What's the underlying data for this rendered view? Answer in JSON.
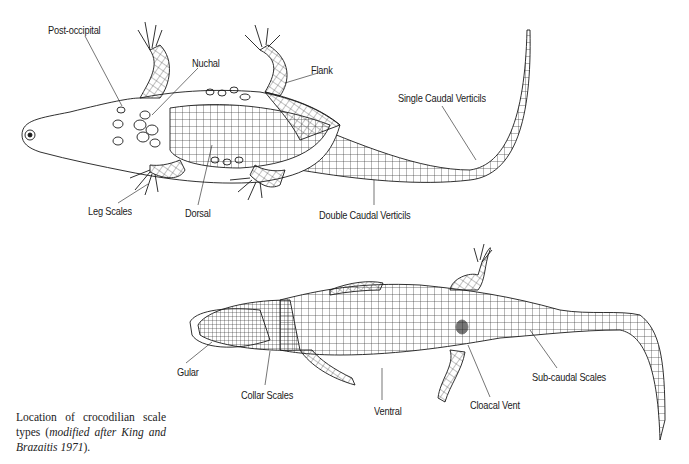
{
  "figure": {
    "top_view": {
      "description": "Dorsal view of crocodilian",
      "labels": [
        {
          "id": "post-occipital",
          "text": "Post-occipital",
          "x": 48,
          "y": 24
        },
        {
          "id": "nuchal",
          "text": "Nuchal",
          "x": 192,
          "y": 57
        },
        {
          "id": "flank",
          "text": "Flank",
          "x": 311,
          "y": 64
        },
        {
          "id": "single-caudal-verticils",
          "text": "Single Caudal Verticils",
          "x": 398,
          "y": 92
        },
        {
          "id": "leg-scales",
          "text": "Leg Scales",
          "x": 88,
          "y": 205
        },
        {
          "id": "dorsal",
          "text": "Dorsal",
          "x": 185,
          "y": 207
        },
        {
          "id": "double-caudal-verticils",
          "text": "Double Caudal Verticils",
          "x": 319,
          "y": 209
        }
      ]
    },
    "bottom_view": {
      "description": "Ventral view of crocodilian",
      "labels": [
        {
          "id": "gular",
          "text": "Gular",
          "x": 177,
          "y": 366
        },
        {
          "id": "collar-scales",
          "text": "Collar Scales",
          "x": 241,
          "y": 389
        },
        {
          "id": "ventral",
          "text": "Ventral",
          "x": 374,
          "y": 405
        },
        {
          "id": "cloacal-vent",
          "text": "Cloacal Vent",
          "x": 470,
          "y": 399
        },
        {
          "id": "sub-caudal-scales",
          "text": "Sub-caudal Scales",
          "x": 532,
          "y": 371
        }
      ]
    },
    "caption": {
      "plain": "Location of crocodilian scale types (",
      "italic": "modified after King and Brazaitis 1971",
      "end": ")."
    }
  },
  "colors": {
    "ink": "#1a1a1a",
    "background": "#ffffff"
  }
}
